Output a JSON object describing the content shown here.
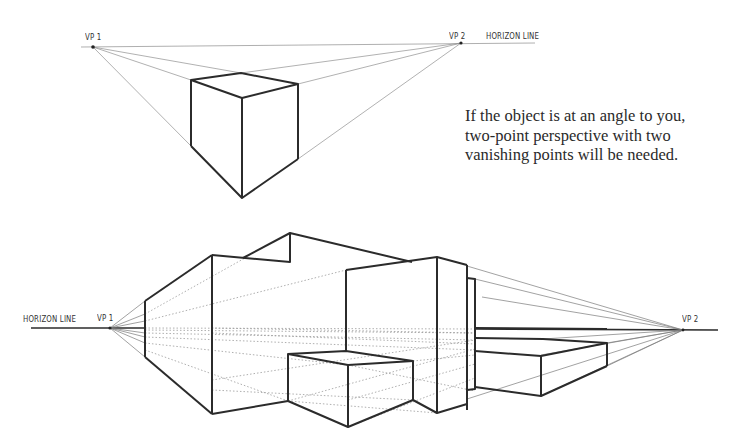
{
  "top_diagram": {
    "vp1_label": "VP 1",
    "vp2_label": "VP 2",
    "horizon_label": "HORIZON LINE"
  },
  "caption": {
    "lines": [
      "If the object is at an angle to you,",
      "two-point perspective with two",
      "vanishing points will be needed."
    ]
  },
  "bottom_diagram": {
    "horizon_label": "HORIZON LINE",
    "vp1_label": "VP 1",
    "vp2_label": "VP 2"
  },
  "colors": {
    "ink": "#2b2b2b",
    "guide": "#8a8a8a",
    "dotted": "#9a9a9a",
    "text": "#2a2a2a"
  }
}
